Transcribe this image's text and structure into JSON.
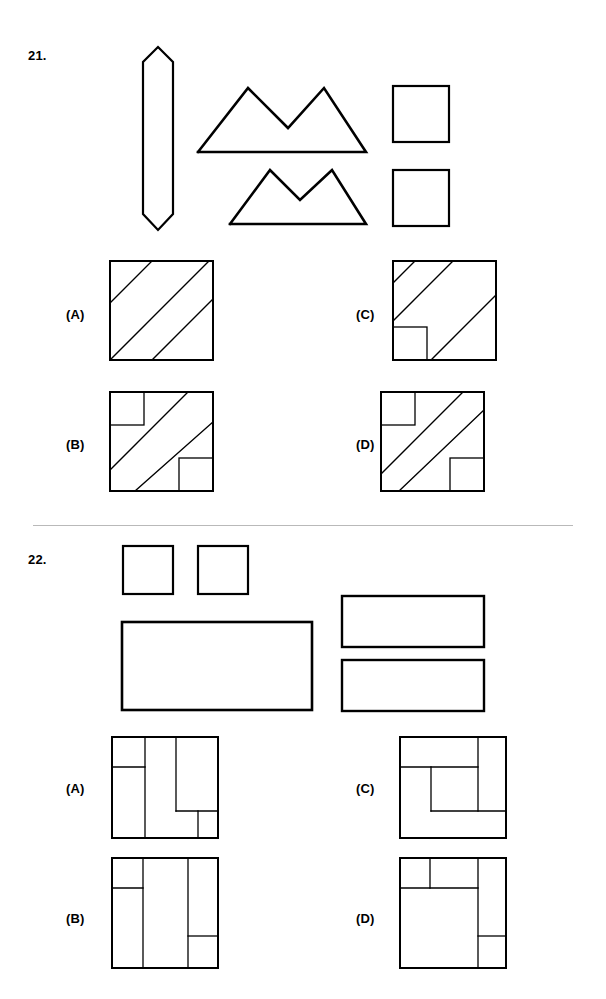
{
  "page": {
    "width": 606,
    "height": 999,
    "background": "#ffffff",
    "ink_color": "#000000",
    "divider_color": "#b9b9b9"
  },
  "divider": {
    "name": "section-divider",
    "x": 33,
    "y": 525,
    "width": 540
  },
  "questions": [
    {
      "number": "21.",
      "number_pos": {
        "x": 28,
        "y": 48
      },
      "prompt_shapes": [
        {
          "name": "elongated-hexagon",
          "kind": "polygon",
          "x": 142,
          "y": 46,
          "width": 36,
          "height": 186,
          "points": "16,1 31,16 31,168 16,184 1,168 1,16",
          "stroke": 2.2
        },
        {
          "name": "double-peak-mountain-large",
          "kind": "polyline",
          "x": 196,
          "y": 84,
          "width": 172,
          "height": 72,
          "points": "2,68 52,4 92,44 128,4 170,68 2,68",
          "stroke": 2.6
        },
        {
          "name": "double-peak-mountain-small",
          "kind": "polyline",
          "x": 228,
          "y": 166,
          "width": 140,
          "height": 62,
          "points": "2,58 42,4 72,34 104,4 138,58 2,58",
          "stroke": 2.6
        },
        {
          "name": "square-top",
          "kind": "rect",
          "x": 393,
          "y": 86,
          "width": 56,
          "height": 56,
          "stroke": 2.2
        },
        {
          "name": "square-bottom",
          "kind": "rect",
          "x": 393,
          "y": 170,
          "width": 56,
          "height": 56,
          "stroke": 2.2
        }
      ],
      "options": [
        {
          "label": "(A)",
          "label_pos": {
            "x": 66,
            "y": 307
          },
          "box": {
            "x": 110,
            "y": 261,
            "width": 103,
            "height": 99
          },
          "lines": [
            {
              "name": "diagonal-line-1",
              "x1": 0,
              "y1": 42,
              "x2": 42,
              "y2": 0
            },
            {
              "name": "diagonal-line-2",
              "x1": 0,
              "y1": 99,
              "x2": 99,
              "y2": 0
            },
            {
              "name": "diagonal-line-3",
              "x1": 42,
              "y1": 99,
              "x2": 103,
              "y2": 38
            }
          ],
          "rects": []
        },
        {
          "label": "(B)",
          "label_pos": {
            "x": 66,
            "y": 437
          },
          "box": {
            "x": 110,
            "y": 392,
            "width": 103,
            "height": 99
          },
          "lines": [
            {
              "name": "diagonal-line-1",
              "x1": 0,
              "y1": 78,
              "x2": 78,
              "y2": 0
            },
            {
              "name": "diagonal-line-2",
              "x1": 25,
              "y1": 99,
              "x2": 103,
              "y2": 30
            }
          ],
          "rects": [
            {
              "name": "corner-square-top-left",
              "x": 0,
              "y": 0,
              "width": 34,
              "height": 33
            },
            {
              "name": "corner-square-bottom-right",
              "x": 69,
              "y": 66,
              "width": 34,
              "height": 33
            }
          ]
        },
        {
          "label": "(C)",
          "label_pos": {
            "x": 356,
            "y": 307
          },
          "box": {
            "x": 393,
            "y": 261,
            "width": 103,
            "height": 99
          },
          "lines": [
            {
              "name": "diagonal-line-1",
              "x1": 0,
              "y1": 22,
              "x2": 22,
              "y2": 0
            },
            {
              "name": "diagonal-line-2",
              "x1": 0,
              "y1": 60,
              "x2": 60,
              "y2": 0
            },
            {
              "name": "diagonal-line-3",
              "x1": 38,
              "y1": 99,
              "x2": 103,
              "y2": 34
            },
            {
              "name": "diagonal-line-4",
              "x1": 72,
              "y1": 0,
              "x2": 103,
              "y2": 0
            }
          ],
          "rects": [
            {
              "name": "corner-square-bottom-left",
              "x": 0,
              "y": 66,
              "width": 34,
              "height": 33
            }
          ]
        },
        {
          "label": "(D)",
          "label_pos": {
            "x": 356,
            "y": 437
          },
          "box": {
            "x": 381,
            "y": 392,
            "width": 103,
            "height": 99
          },
          "lines": [
            {
              "name": "diagonal-line-1",
              "x1": 0,
              "y1": 82,
              "x2": 82,
              "y2": 0
            },
            {
              "name": "diagonal-line-2",
              "x1": 18,
              "y1": 99,
              "x2": 103,
              "y2": 18
            }
          ],
          "rects": [
            {
              "name": "corner-square-top-left",
              "x": 0,
              "y": 0,
              "width": 34,
              "height": 33
            },
            {
              "name": "corner-square-bottom-right",
              "x": 69,
              "y": 66,
              "width": 34,
              "height": 33
            }
          ]
        }
      ]
    },
    {
      "number": "22.",
      "number_pos": {
        "x": 28,
        "y": 552
      },
      "prompt_shapes": [
        {
          "name": "small-square-left",
          "kind": "rect",
          "x": 123,
          "y": 546,
          "width": 50,
          "height": 48,
          "stroke": 2.2
        },
        {
          "name": "small-square-right",
          "kind": "rect",
          "x": 198,
          "y": 546,
          "width": 50,
          "height": 48,
          "stroke": 2.2
        },
        {
          "name": "large-rectangle",
          "kind": "rect",
          "x": 122,
          "y": 622,
          "width": 190,
          "height": 88,
          "stroke": 2.6
        },
        {
          "name": "wide-rectangle-top",
          "kind": "rect",
          "x": 342,
          "y": 596,
          "width": 142,
          "height": 51,
          "stroke": 2.4
        },
        {
          "name": "wide-rectangle-bottom",
          "kind": "rect",
          "x": 342,
          "y": 660,
          "width": 142,
          "height": 51,
          "stroke": 2.4
        }
      ],
      "options": [
        {
          "label": "(A)",
          "label_pos": {
            "x": 66,
            "y": 781
          },
          "box": {
            "x": 112,
            "y": 737,
            "width": 106,
            "height": 101
          },
          "lines": [
            {
              "name": "vertical-divider-1",
              "x1": 33,
              "y1": 0,
              "x2": 33,
              "y2": 101
            },
            {
              "name": "horizontal-divider-1",
              "x1": 0,
              "y1": 30,
              "x2": 33,
              "y2": 30
            },
            {
              "name": "vertical-divider-2",
              "x1": 64,
              "y1": 0,
              "x2": 64,
              "y2": 74
            },
            {
              "name": "horizontal-divider-2",
              "x1": 64,
              "y1": 74,
              "x2": 106,
              "y2": 74
            },
            {
              "name": "vertical-divider-3",
              "x1": 86,
              "y1": 74,
              "x2": 86,
              "y2": 101
            }
          ],
          "rects": []
        },
        {
          "label": "(B)",
          "label_pos": {
            "x": 66,
            "y": 911
          },
          "box": {
            "x": 112,
            "y": 858,
            "width": 106,
            "height": 110
          },
          "lines": [
            {
              "name": "vertical-divider-1",
              "x1": 31,
              "y1": 0,
              "x2": 31,
              "y2": 110
            },
            {
              "name": "horizontal-divider-1",
              "x1": 0,
              "y1": 30,
              "x2": 31,
              "y2": 30
            },
            {
              "name": "vertical-divider-2",
              "x1": 76,
              "y1": 0,
              "x2": 76,
              "y2": 110
            },
            {
              "name": "horizontal-divider-2",
              "x1": 76,
              "y1": 78,
              "x2": 106,
              "y2": 78
            }
          ],
          "rects": []
        },
        {
          "label": "(C)",
          "label_pos": {
            "x": 356,
            "y": 781
          },
          "box": {
            "x": 400,
            "y": 737,
            "width": 106,
            "height": 101
          },
          "lines": [
            {
              "name": "horizontal-divider-1",
              "x1": 0,
              "y1": 30,
              "x2": 78,
              "y2": 30
            },
            {
              "name": "vertical-divider-1",
              "x1": 78,
              "y1": 0,
              "x2": 78,
              "y2": 74
            },
            {
              "name": "vertical-divider-2",
              "x1": 31,
              "y1": 30,
              "x2": 31,
              "y2": 74
            },
            {
              "name": "horizontal-divider-2",
              "x1": 31,
              "y1": 74,
              "x2": 106,
              "y2": 74
            }
          ],
          "rects": []
        },
        {
          "label": "(D)",
          "label_pos": {
            "x": 356,
            "y": 911
          },
          "box": {
            "x": 400,
            "y": 858,
            "width": 106,
            "height": 110
          },
          "lines": [
            {
              "name": "horizontal-divider-1",
              "x1": 0,
              "y1": 30,
              "x2": 78,
              "y2": 30
            },
            {
              "name": "vertical-divider-1",
              "x1": 30,
              "y1": 0,
              "x2": 30,
              "y2": 30
            },
            {
              "name": "vertical-divider-2",
              "x1": 78,
              "y1": 0,
              "x2": 78,
              "y2": 110
            },
            {
              "name": "horizontal-divider-2",
              "x1": 78,
              "y1": 78,
              "x2": 106,
              "y2": 78
            }
          ],
          "rects": []
        }
      ]
    }
  ]
}
